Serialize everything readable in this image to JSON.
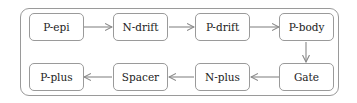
{
  "diagram": {
    "type": "process-flow",
    "colors": {
      "border": "#9a9a9a",
      "arrow": "#888888",
      "text": "#222222",
      "background": "#ffffff"
    },
    "nodes": [
      {
        "id": "p_epi",
        "label": "P-epi"
      },
      {
        "id": "n_drift",
        "label": "N-drift"
      },
      {
        "id": "p_drift",
        "label": "P-drift"
      },
      {
        "id": "p_body",
        "label": "P-body"
      },
      {
        "id": "gate",
        "label": "Gate"
      },
      {
        "id": "n_plus",
        "label": "N-plus"
      },
      {
        "id": "spacer",
        "label": "Spacer"
      },
      {
        "id": "p_plus",
        "label": "P-plus"
      }
    ],
    "edges": [
      {
        "from": "P-epi",
        "to": "N-drift"
      },
      {
        "from": "N-drift",
        "to": "P-drift"
      },
      {
        "from": "P-drift",
        "to": "P-body"
      },
      {
        "from": "P-body",
        "to": "Gate"
      },
      {
        "from": "Gate",
        "to": "N-plus"
      },
      {
        "from": "N-plus",
        "to": "Spacer"
      },
      {
        "from": "Spacer",
        "to": "P-plus"
      }
    ]
  }
}
